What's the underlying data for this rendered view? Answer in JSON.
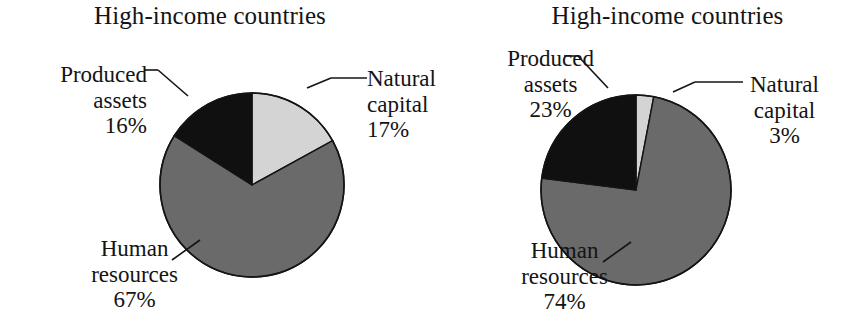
{
  "figure": {
    "background_color": "#ffffff",
    "text_color": "#141414"
  },
  "colors": {
    "natural_capital": "#d4d4d4",
    "human_resources": "#6a6a6a",
    "produced_assets": "#101010",
    "outline": "#141414"
  },
  "panels": [
    {
      "id": "left",
      "title": "High-income countries",
      "labels": {
        "produced": {
          "name": "Produced",
          "name2": "assets",
          "value": "16%"
        },
        "natural": {
          "name": "Natural",
          "name2": "capital",
          "value": "17%"
        },
        "human": {
          "name": "Human",
          "name2": "resources",
          "value": "67%"
        }
      }
    },
    {
      "id": "right",
      "title": "High-income countries",
      "labels": {
        "produced": {
          "name": "Produced",
          "name2": "assets",
          "value": "23%"
        },
        "natural": {
          "name": "Natural",
          "name2": "capital",
          "value": "3%"
        },
        "human": {
          "name": "Human",
          "name2": "resources",
          "value": "74%"
        }
      }
    }
  ],
  "chart_data": [
    {
      "type": "pie",
      "title": "High-income countries",
      "categories": [
        "Natural capital",
        "Human resources",
        "Produced assets"
      ],
      "values": [
        17,
        67,
        16
      ],
      "value_labels": [
        "17%",
        "67%",
        "16%"
      ],
      "units": "percent",
      "start_angle_deg": 0,
      "direction": "clockwise",
      "slice_colors": [
        "#d4d4d4",
        "#6a6a6a",
        "#101010"
      ],
      "legend": "none",
      "labels_position": "outside-with-leader-lines",
      "grid": false
    },
    {
      "type": "pie",
      "title": "High-income countries",
      "categories": [
        "Natural capital",
        "Human resources",
        "Produced assets"
      ],
      "values": [
        3,
        74,
        23
      ],
      "value_labels": [
        "3%",
        "74%",
        "23%"
      ],
      "units": "percent",
      "start_angle_deg": 0,
      "direction": "clockwise",
      "slice_colors": [
        "#d4d4d4",
        "#6a6a6a",
        "#101010"
      ],
      "legend": "none",
      "labels_position": "outside-with-leader-lines",
      "grid": false
    }
  ]
}
